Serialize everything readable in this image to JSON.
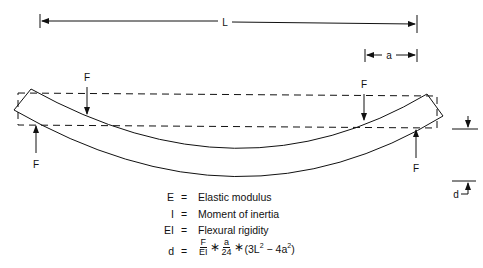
{
  "diagram": {
    "dimensions": {
      "span_label": "L",
      "offset_label": "a",
      "deflection_label": "d"
    },
    "force_label": "F",
    "forces": [
      {
        "position": "left-support",
        "direction": "up",
        "label": "F"
      },
      {
        "position": "left-load",
        "direction": "down",
        "label": "F"
      },
      {
        "position": "right-load",
        "direction": "down",
        "label": "F"
      },
      {
        "position": "right-support",
        "direction": "up",
        "label": "F"
      }
    ]
  },
  "legend": [
    {
      "symbol": "E",
      "eq": "=",
      "definition": "Elastic modulus"
    },
    {
      "symbol": "I",
      "eq": "=",
      "definition": "Moment of inertia"
    },
    {
      "symbol": "EI",
      "eq": "=",
      "definition": "Flexural rigidity"
    }
  ],
  "formula": {
    "lhs": "d",
    "eq": "=",
    "frac1_num": "F",
    "frac1_den": "EI",
    "times1": "∗",
    "frac2_num": "a",
    "frac2_den": "24",
    "times2": "∗",
    "paren_open": "(3L",
    "exp1": "2",
    "minus": " − 4a",
    "exp2": "2",
    "paren_close": ")"
  },
  "colors": {
    "line": "#111111",
    "background": "#ffffff"
  }
}
